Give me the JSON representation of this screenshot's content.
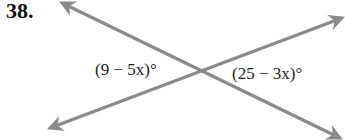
{
  "problem": {
    "number": "38."
  },
  "figure": {
    "line_color": "#8a8a8a",
    "angles": [
      {
        "position": "left",
        "expression": "(9 − 5x)°"
      },
      {
        "position": "right",
        "expression": "(25 − 3x)°"
      }
    ]
  }
}
